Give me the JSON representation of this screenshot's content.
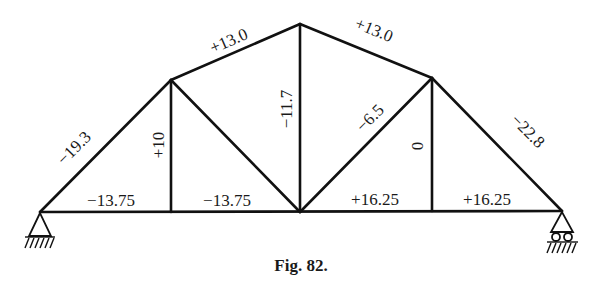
{
  "figure": {
    "caption": "Fig. 82."
  },
  "nodes": {
    "left_support": [
      40,
      212
    ],
    "upper_left": [
      171,
      80
    ],
    "apex": [
      300,
      24
    ],
    "upper_right": [
      432,
      78
    ],
    "right_support": [
      562,
      211
    ],
    "bottom_1": [
      171,
      212
    ],
    "bottom_2": [
      300,
      212
    ],
    "bottom_3": [
      432,
      211
    ]
  },
  "members": [
    {
      "id": "left-rafter",
      "force": "−19.3"
    },
    {
      "id": "top-chord-left",
      "force": "+13.0"
    },
    {
      "id": "top-chord-right",
      "force": "+13.0"
    },
    {
      "id": "right-rafter",
      "force": "−22.8"
    },
    {
      "id": "vertical-left",
      "force": "+10"
    },
    {
      "id": "vertical-center",
      "force": "−11.7"
    },
    {
      "id": "diagonal-right",
      "force": "−6.5"
    },
    {
      "id": "vertical-right",
      "force": "0"
    },
    {
      "id": "bottom-chord-1",
      "force": "−13.75"
    },
    {
      "id": "bottom-chord-2",
      "force": "−13.75"
    },
    {
      "id": "bottom-chord-3",
      "force": "+16.25"
    },
    {
      "id": "bottom-chord-4",
      "force": "+16.25"
    },
    {
      "id": "diagonal-left",
      "force": ""
    }
  ],
  "supports": {
    "left": "pinned",
    "right": "roller"
  }
}
